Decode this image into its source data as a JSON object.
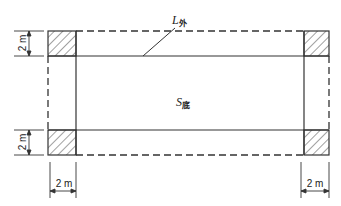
{
  "diagram": {
    "type": "plan-view",
    "labels": {
      "outer_perimeter": {
        "main": "L",
        "subscript": "外"
      },
      "base_area": {
        "main": "S",
        "subscript": "底"
      }
    },
    "dimensions": {
      "top_left_vertical": "2 m",
      "bottom_left_vertical": "2 m",
      "bottom_left_horizontal": "2 m",
      "bottom_right_horizontal": "2 m"
    },
    "colors": {
      "line": "#333333",
      "background": "#ffffff"
    }
  }
}
